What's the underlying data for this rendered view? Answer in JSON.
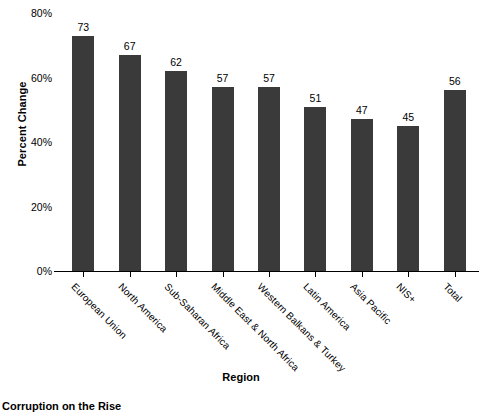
{
  "chart_data": {
    "type": "bar",
    "title": "",
    "caption": "Corruption on the Rise",
    "xlabel": "Region",
    "ylabel": "Percent Change",
    "ylim": [
      0,
      80
    ],
    "ytick_labels": [
      "0%",
      "20%",
      "40%",
      "60%",
      "80%"
    ],
    "ytick_values": [
      0,
      20,
      40,
      60,
      80
    ],
    "grid": false,
    "legend": null,
    "bar_color": "#3a3a3a",
    "categories": [
      "European Union",
      "North America",
      "Sub-Saharan Africa",
      "Middle East & North Africa",
      "Western Balkans & Turkey",
      "Latin America",
      "Asia Pacific",
      "NIS+",
      "Total"
    ],
    "values": [
      73,
      67,
      62,
      57,
      57,
      51,
      47,
      45,
      56
    ],
    "value_labels": [
      "73",
      "67",
      "62",
      "57",
      "57",
      "51",
      "47",
      "45",
      "56"
    ]
  }
}
